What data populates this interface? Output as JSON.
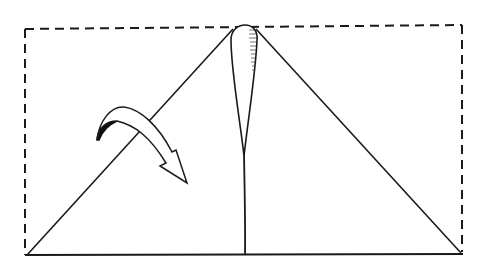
{
  "diagram": {
    "type": "origami-fold-step",
    "colors": {
      "background": "#ffffff",
      "stroke": "#1a1a1a",
      "arrow_fill": "#ffffff",
      "arrow_shadow": "#111111"
    },
    "elements": {
      "outline": {
        "label": "paper-outline-dashed",
        "style": "dashed"
      },
      "triangle": {
        "label": "folded-triangle"
      },
      "center_crease": {
        "label": "center-crease"
      },
      "petal": {
        "label": "center-petal-flap",
        "hatched_side": "right"
      },
      "arrow": {
        "label": "fold-arrow",
        "direction": "down-right"
      }
    }
  }
}
